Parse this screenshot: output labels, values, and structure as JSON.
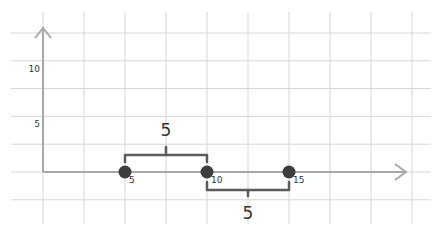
{
  "diagram": {
    "type": "number-line",
    "title": "",
    "y_axis": {
      "tick_labels": [
        {
          "value": 10,
          "text": "10"
        },
        {
          "value": 5,
          "text": "5"
        }
      ]
    },
    "x_axis": {
      "arrow": "right"
    },
    "points": [
      {
        "value": 5,
        "label": "5"
      },
      {
        "value": 10,
        "label": "10"
      },
      {
        "value": 15,
        "label": "15"
      }
    ],
    "braces": [
      {
        "from": 5,
        "to": 10,
        "side": "above",
        "label": "5"
      },
      {
        "from": 10,
        "to": 15,
        "side": "below",
        "label": "5"
      }
    ],
    "colors": {
      "grid": "#d6d6d6",
      "axis": "#a8a8a8",
      "point": "#3d3d3d",
      "brace": "#5a5a5a",
      "text": "#333333"
    }
  }
}
